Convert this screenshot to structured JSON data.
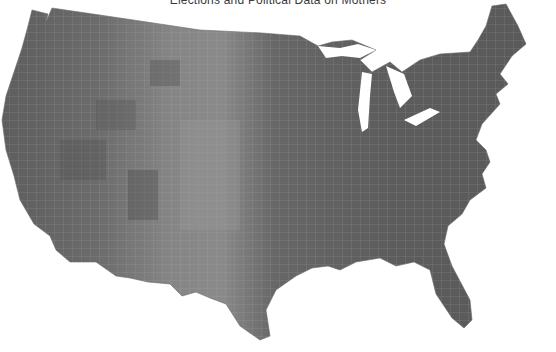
{
  "header": {
    "title": "Elections and Political Data on Mothers"
  },
  "map": {
    "type": "choropleth",
    "region": "Contiguous United States",
    "unit": "county",
    "color_scale": "grayscale",
    "colors": {
      "background": "#ffffff",
      "dark": "#505050",
      "mid": "#6a6a6a",
      "light": "#8e8e8e",
      "borders": "#b9b9b9"
    },
    "regions_visible": [
      "West",
      "Mountain",
      "Great Plains",
      "Midwest",
      "Great Lakes",
      "Northeast",
      "Southeast",
      "Gulf Coast",
      "Texas",
      "Florida"
    ]
  }
}
